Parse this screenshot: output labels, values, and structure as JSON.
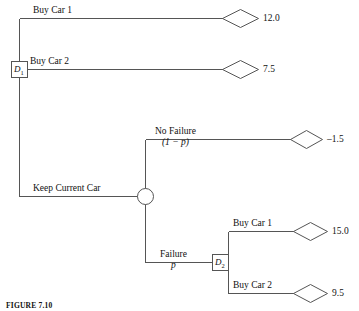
{
  "figure": {
    "caption": "FIGURE 7.10"
  },
  "diagram": {
    "type": "decision-tree",
    "stroke_color": "#555555",
    "text_color": "#111111",
    "background": "#ffffff",
    "nodes": [
      {
        "id": "D1",
        "kind": "decision",
        "label": "D",
        "subscript": "1"
      },
      {
        "id": "C1",
        "kind": "chance",
        "label": ""
      },
      {
        "id": "D2",
        "kind": "decision",
        "label": "D",
        "subscript": "2"
      }
    ],
    "branches": [
      {
        "id": "b1",
        "from": "D1",
        "label": "Buy Car 1",
        "payoff": "12.0"
      },
      {
        "id": "b2",
        "from": "D1",
        "label": "Buy Car 2",
        "payoff": "7.5"
      },
      {
        "id": "b3",
        "from": "D1",
        "label": "Keep Current Car",
        "to": "C1"
      },
      {
        "id": "b4",
        "from": "C1",
        "label": "No Failure",
        "probability": "(1 − p)",
        "prob_text": "(1 − ",
        "prob_var": "p",
        "prob_tail": ")",
        "payoff": "–1.5"
      },
      {
        "id": "b5",
        "from": "C1",
        "label": "Failure",
        "probability": "p",
        "to": "D2"
      },
      {
        "id": "b6",
        "from": "D2",
        "label": "Buy Car 1",
        "payoff": "15.0"
      },
      {
        "id": "b7",
        "from": "D2",
        "label": "Buy Car 2",
        "payoff": "9.5"
      }
    ]
  }
}
